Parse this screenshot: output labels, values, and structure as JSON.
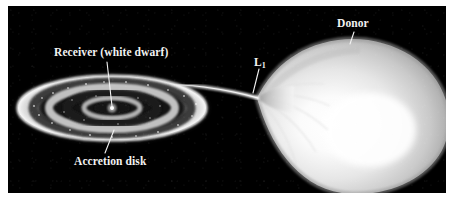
{
  "figure": {
    "background_color": "#ffffff",
    "panel_color": "#000000",
    "label_color": "#f2f2f2"
  },
  "labels": {
    "receiver": "Receiver (white dwarf)",
    "accretion_disk": "Accretion disk",
    "lagrange_point": "L",
    "lagrange_point_subscript": "1",
    "donor": "Donor"
  },
  "objects": {
    "accretion_disk": {
      "name": "accretion-disk",
      "shape": "ellipse",
      "center_x": 104,
      "center_y": 102,
      "radius_x": 94,
      "radius_y": 32,
      "rings": 5
    },
    "white_dwarf": {
      "name": "white-dwarf",
      "shape": "point",
      "center_x": 104,
      "center_y": 102,
      "radius": 2
    },
    "donor_star": {
      "name": "donor-star",
      "shape": "roche-lobe-teardrop",
      "tip_x": 249,
      "tip_y": 92,
      "body_center_x": 355,
      "body_center_y": 115,
      "body_radius_x": 88,
      "body_radius_y": 75,
      "hotspot_x": 362,
      "hotspot_y": 124
    },
    "accretion_stream": {
      "name": "accretion-stream",
      "from_x": 249,
      "from_y": 92,
      "to_x": 196,
      "to_y": 82
    }
  },
  "leader_lines": {
    "receiver": {
      "x1": 99,
      "y1": 56,
      "x2": 104,
      "y2": 100
    },
    "accretion_disk": {
      "x1": 97,
      "y1": 147,
      "x2": 106,
      "y2": 124
    },
    "lagrange_point": {
      "x1": 251,
      "y1": 63,
      "x2": 245,
      "y2": 87
    },
    "donor": {
      "x1": 346,
      "y1": 26,
      "x2": 342,
      "y2": 38
    }
  }
}
